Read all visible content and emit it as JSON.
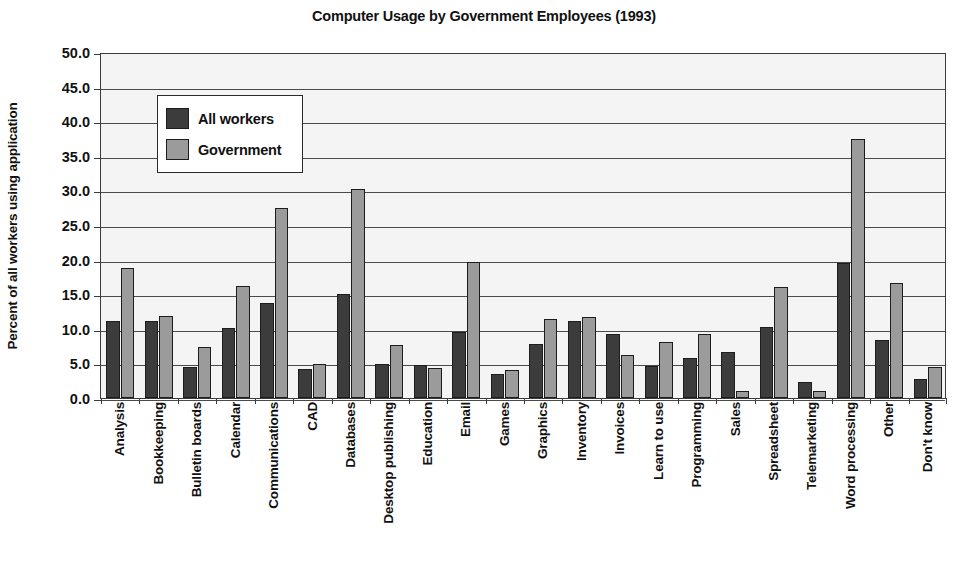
{
  "chart_data": {
    "type": "bar",
    "title": "Computer Usage by Government Employees (1993)",
    "xlabel": "",
    "ylabel": "Percent of all workers using application",
    "ylim": [
      0,
      50
    ],
    "ytick_step": 5,
    "ytick_labels": [
      "50.0",
      "45.0",
      "40.0",
      "35.0",
      "30.0",
      "25.0",
      "20.0",
      "15.0",
      "10.0",
      "5.0",
      "0.0"
    ],
    "grid": true,
    "legend_position": "upper-left-inside",
    "categories": [
      "Analysis",
      "Bookkeeping",
      "Bulletin boards",
      "Calendar",
      "Communications",
      "CAD",
      "Databases",
      "Desktop publishing",
      "Education",
      "Email",
      "Games",
      "Graphics",
      "Inventory",
      "Invoices",
      "Learn to use",
      "Programming",
      "Sales",
      "Spreadsheet",
      "Telemarketing",
      "Word processing",
      "Other",
      "Don't know"
    ],
    "series": [
      {
        "name": "All workers",
        "color": "#3c3c3c",
        "values": [
          11.1,
          11.2,
          4.5,
          10.1,
          13.8,
          4.2,
          15.0,
          4.9,
          4.7,
          9.6,
          3.4,
          7.8,
          11.1,
          9.2,
          4.6,
          5.8,
          6.7,
          10.2,
          2.3,
          19.5,
          8.4,
          2.7
        ]
      },
      {
        "name": "Government",
        "color": "#9b9b9b",
        "values": [
          18.8,
          11.9,
          7.4,
          16.2,
          27.5,
          4.9,
          30.2,
          7.6,
          4.3,
          19.6,
          4.1,
          11.4,
          11.7,
          6.2,
          8.1,
          9.2,
          1.0,
          16.1,
          1.0,
          37.5,
          16.6,
          4.5
        ]
      }
    ]
  },
  "colors": {
    "all_workers": "#3c3c3c",
    "government": "#9b9b9b",
    "plot_background": "#f4f4f4",
    "axis": "#3b3b3b",
    "text": "#111111"
  }
}
